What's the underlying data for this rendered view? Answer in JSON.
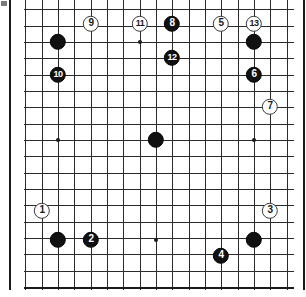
{
  "diagram": {
    "type": "go-board-problem-diagram",
    "board_size": 19,
    "visible_columns": 18,
    "visible_rows": 18,
    "background_color": "#ffffff",
    "line_color": "#2b2b2b",
    "black_stone_color": "#111111",
    "white_stone_color": "#ffffff",
    "geometry": {
      "x0": 58,
      "y0": 42,
      "spacing": 16.33,
      "col0_index": 3,
      "row0_index": 3,
      "stone_radius": 8.2,
      "left_edge": 25,
      "top_edge": -7,
      "right_edge": 293,
      "bottom_edge": 287
    },
    "star_points": [
      {
        "x": 58,
        "y": 42
      },
      {
        "x": 140,
        "y": 42
      },
      {
        "x": 254,
        "y": 42
      },
      {
        "x": 58,
        "y": 140
      },
      {
        "x": 156,
        "y": 140
      },
      {
        "x": 254,
        "y": 140
      },
      {
        "x": 58,
        "y": 240
      },
      {
        "x": 156,
        "y": 240
      },
      {
        "x": 254,
        "y": 240
      }
    ],
    "stones": [
      {
        "id": "stone-b-unnumbered-1",
        "color": "black",
        "label": "",
        "x": 58,
        "y": 42
      },
      {
        "id": "stone-b-unnumbered-2",
        "color": "black",
        "label": "",
        "x": 254,
        "y": 42
      },
      {
        "id": "stone-b-unnumbered-3",
        "color": "black",
        "label": "",
        "x": 156,
        "y": 140
      },
      {
        "id": "stone-b-unnumbered-4",
        "color": "black",
        "label": "",
        "x": 58,
        "y": 240
      },
      {
        "id": "stone-b-unnumbered-5",
        "color": "black",
        "label": "",
        "x": 254,
        "y": 240
      },
      {
        "id": "stone-w-1",
        "color": "white",
        "label": "1",
        "x": 42,
        "y": 211
      },
      {
        "id": "stone-b-2",
        "color": "black",
        "label": "2",
        "x": 91,
        "y": 240
      },
      {
        "id": "stone-w-3",
        "color": "white",
        "label": "3",
        "x": 270,
        "y": 211
      },
      {
        "id": "stone-b-4",
        "color": "black",
        "label": "4",
        "x": 221,
        "y": 256
      },
      {
        "id": "stone-w-5",
        "color": "white",
        "label": "5",
        "x": 221,
        "y": 24
      },
      {
        "id": "stone-b-6",
        "color": "black",
        "label": "6",
        "x": 254,
        "y": 75
      },
      {
        "id": "stone-w-7",
        "color": "white",
        "label": "7",
        "x": 270,
        "y": 107
      },
      {
        "id": "stone-b-8",
        "color": "black",
        "label": "8",
        "x": 172,
        "y": 24
      },
      {
        "id": "stone-w-9",
        "color": "white",
        "label": "9",
        "x": 91,
        "y": 24
      },
      {
        "id": "stone-b-10",
        "color": "black",
        "label": "10",
        "x": 58,
        "y": 75
      },
      {
        "id": "stone-w-11",
        "color": "white",
        "label": "11",
        "x": 140,
        "y": 24
      },
      {
        "id": "stone-b-12",
        "color": "black",
        "label": "12",
        "x": 172,
        "y": 58
      },
      {
        "id": "stone-w-13",
        "color": "white",
        "label": "13",
        "x": 254,
        "y": 24
      }
    ]
  }
}
